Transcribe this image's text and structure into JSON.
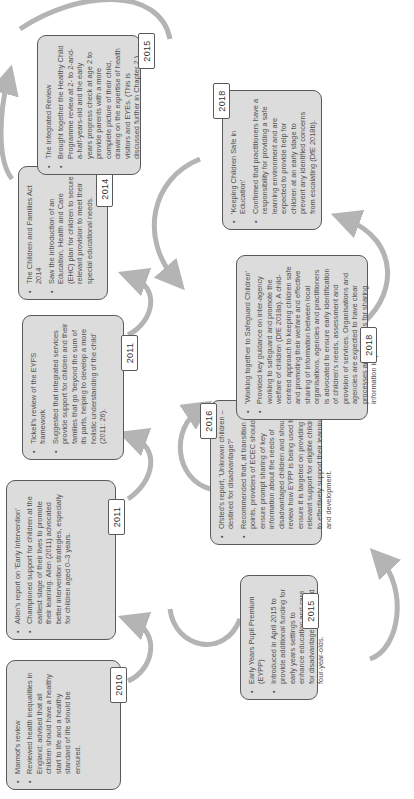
{
  "diagram": {
    "orientation": "rotated-90-ccw",
    "arrow_color": "#b4b4b4",
    "card_fill": "#dcdcdc",
    "row1": [
      {
        "year": "2010",
        "heading": "Marmot's review",
        "detail": "Reviewed health inequalities in England; advised that all children should have a healthy start to life and a healthy standard of life should be ensured."
      },
      {
        "year": "2011",
        "heading": "Allen's report on 'Early Intervention'",
        "detail": "Championed support for children at the earliest stage of their lives to promote their learning. Allen (2011) advocated better intervention strategies, especially for children aged 0–3 years."
      },
      {
        "year": "2011",
        "heading": "Tickell's review of the EYFS framework",
        "detail": "Suggested that integrated services provide support for children and their families that go 'beyond the sum of its parts, helping to develop a more holistic understanding of the child' (2011: 26)."
      },
      {
        "year": "2014",
        "heading": "The Children and Families Act 2014",
        "detail": "Saw the introduction of an Education, Health and Care (EHC) plan for children to secure relevant provision to meet their special educational needs."
      },
      {
        "year": "2015",
        "heading": "The Integrated Review",
        "detail": "Brought together the Healthy Child Programme review at 2- to 2-and-a-half-years-old and the early years progress check at age 2 to provide parents with a more complete picture of their child, drawing on the expertise of health visitors and EYEs. (This is discussed further in Chapter 2.)"
      }
    ],
    "row2": [
      {
        "year": "2015",
        "heading": "Early Years Pupil Premium (EYPP)",
        "detail": "Introduced in April 2015 to provide additional funding for early years settings to enhance education and care for disadvantaged three- and four-year-olds."
      },
      {
        "year": "2016",
        "heading": "Ofsted's report, 'Unknown children – destined for disadvantage?'",
        "detail": "Recommended that, at transition points, providers of ECEC should ensure prompt sharing of key information about the needs of disadvantaged children and should review how EYPP is being used to ensure it is targeted on providing relevant support for eligible children to effectively support their learning and development."
      },
      {
        "year": "2018",
        "heading": "'Working together to Safeguard Children'",
        "detail": "Provided key guidance on inter-agency working to safeguard and promote the welfare of children (DfE 2018a). A child-centred approach to keeping children safe and promoting their welfare and effective sharing of information between local organisations, agencies and practitioners is advocated to ensure early identification of children's needs, assessment and provision of services. Organisations and agencies are expected to have clear processes and principles for sharing information in place."
      },
      {
        "year": "2018",
        "heading": "'Keeping Children Safe in Education'",
        "detail": "Confirmed that practitioners have a responsibility for providing a safe learning environment and are expected to provide help for children at an early stage to prevent any identified concerns from escalating (DfE 2018b)."
      }
    ]
  }
}
